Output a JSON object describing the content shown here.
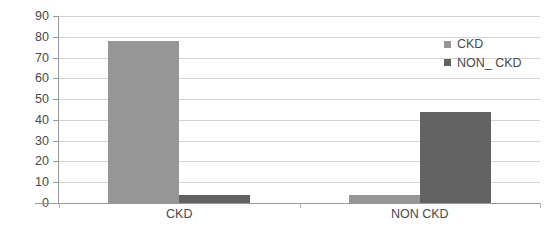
{
  "chart_data": {
    "type": "bar",
    "title": "",
    "subtitle": "",
    "xlabel": "",
    "ylabel": "",
    "categories": [
      "CKD",
      "NON CKD"
    ],
    "series": [
      {
        "name": "CKD",
        "color": "#969696",
        "values": [
          78,
          4
        ]
      },
      {
        "name": "NON_ CKD",
        "color": "#636363",
        "values": [
          4,
          44
        ]
      }
    ],
    "ylim": [
      0,
      90
    ],
    "ytick_step": 10,
    "ytick_labels": [
      "0",
      "10",
      "20",
      "30",
      "40",
      "50",
      "60",
      "70",
      "80",
      "90"
    ],
    "grid": "horizontal",
    "legend_position": "top-right",
    "background": "#ffffff",
    "axis_color": "#9a9a9a",
    "gridline_color": "#d4d4d4",
    "tick_label_color": "#4a4a4a"
  },
  "legend": {
    "items": [
      {
        "label": "CKD"
      },
      {
        "label": "NON_ CKD"
      }
    ]
  }
}
